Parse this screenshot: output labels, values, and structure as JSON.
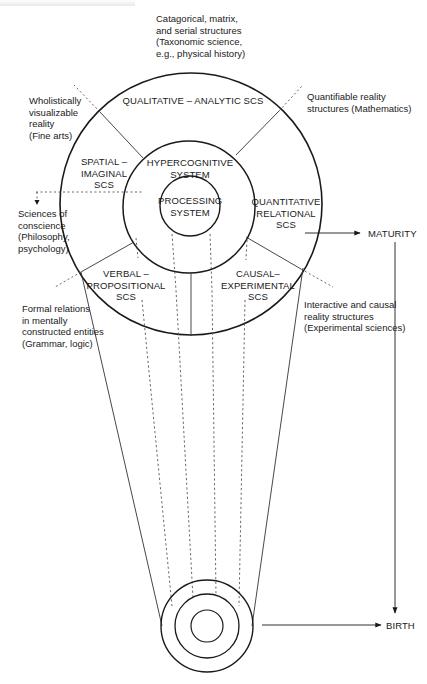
{
  "diagram": {
    "type": "developmental-architecture-of-mind",
    "colors": {
      "stroke": "#1a1a1a",
      "dashed": "#555555",
      "background": "#ffffff"
    },
    "stages": {
      "top": "MATURITY",
      "bottom": "BIRTH"
    },
    "core": {
      "processing": "PROCESSING\nSYSTEM",
      "hypercognitive": "HYPERCOGNITIVE\nSYSTEM"
    },
    "scs": {
      "qualitative_analytic": "QUALITATIVE – ANALYTIC SCS",
      "spatial_imaginal": "SPATIAL –\nIMAGINAL\nSCS",
      "quantitative_relational": "QUANTITATIVE\nRELATIONAL\nSCS",
      "verbal_propositional": "VERBAL –\nPROPOSITIONAL\nSCS",
      "causal_experimental": "CAUSAL–\nEXPERIMENTAL\nSCS"
    },
    "domains": {
      "top": "Catagorical, matrix,\nand serial structures\n(Taxonomic science,\ne.g., physical history)",
      "upper_left": "Wholistically\nvisualizable\nreality\n(Fine arts)",
      "upper_right": "Quantifiable reality\nstructures (Mathematics)",
      "left": "Sciences of\nconscience\n(Philosophy,\npsychology)",
      "lower_left": "Formal relations\nin mentally\nconstructed entities\n(Grammar, logic)",
      "lower_right": "Interactive and causal\nreality structures\n(Experimental sciences)"
    }
  }
}
